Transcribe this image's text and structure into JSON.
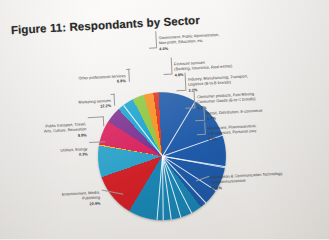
{
  "figure": {
    "title": "Figure 11: Respondants by Sector"
  },
  "chart_data": {
    "type": "pie",
    "title": "Figure 11: Respondants by Sector",
    "xlabel": "",
    "ylabel": "",
    "legend_position": "callout-labels",
    "grid": false,
    "unit": "%",
    "categories": [
      "Information & Communication Technology, Telecommunications",
      "Entertainment, Media, Publishing",
      "Marketing services",
      "Public transport, Travel, Arts, Culture, Recreation",
      "Utilities, Energy",
      "Other professional services",
      "Government, Public Administration, Non-profit, Education, etc",
      "Financial services (Banking, Insurance, Real-estate)",
      "Industry, Manufacturing, Transport, Logistics (B-to-B brands)",
      "Consumer products, Fast Moving Consumer Goods (B-to-C brands)",
      "Retail, Distribution, E-commerce",
      "Healthcare, Pharmaceutical, Life sciences, Personal care"
    ],
    "values": [
      42.1,
      20.9,
      12.2,
      8.8,
      0.3,
      6.8,
      4.4,
      4.8,
      3.2,
      2.7,
      2.2,
      1.7
    ],
    "colors": [
      "#1f5aa8",
      "#1b86b4",
      "#cf2027",
      "#2aa0c8",
      "#f2c10e",
      "#d81f5c",
      "#7b2f8f",
      "#1aa3d0",
      "#8cc63e",
      "#f5901f",
      "#e03020",
      "#d6252a"
    ],
    "slices": [
      {
        "label": "Information & Communication Technology, Telecommunications",
        "value": 42.1,
        "pct": "42.1%",
        "color": "#1f5aa8"
      },
      {
        "label": "Entertainment, Media, Publishing",
        "value": 20.9,
        "pct": "20.9%",
        "color": "#1b86b4"
      },
      {
        "label": "Marketing services",
        "value": 12.2,
        "pct": "12.2%",
        "color": "#cf2027"
      },
      {
        "label": "Public transport, Travel, Arts, Culture, Recreation",
        "value": 8.8,
        "pct": "8.8%",
        "color": "#2aa0c8"
      },
      {
        "label": "Utilities, Energy",
        "value": 0.3,
        "pct": "0.3%",
        "color": "#f2c10e"
      },
      {
        "label": "Other professional services",
        "value": 6.8,
        "pct": "6.8%",
        "color": "#d81f5c"
      },
      {
        "label": "Government, Public Administration, Non-profit, Education, etc",
        "value": 4.4,
        "pct": "4.4%",
        "color": "#7b2f8f"
      },
      {
        "label": "Financial services (Banking, Insurance, Real-estate)",
        "value": 4.8,
        "pct": "4.8%",
        "color": "#1aa3d0"
      },
      {
        "label": "Industry, Manufacturing, Transport, Logistics (B-to-B brands)",
        "value": 3.2,
        "pct": "3.2%",
        "color": "#8cc63e"
      },
      {
        "label": "Consumer products, Fast Moving Consumer Goods (B-to-C brands)",
        "value": 2.7,
        "pct": "2.7%",
        "color": "#f5901f"
      },
      {
        "label": "Retail, Distribution, E-commerce",
        "value": 2.2,
        "pct": "2.2%",
        "color": "#e03020"
      },
      {
        "label": "Healthcare, Pharmaceutical, Life sciences, Personal care",
        "value": 1.7,
        "pct": "1.7%",
        "color": "#d6252a"
      }
    ]
  },
  "labels": {
    "government": {
      "text": "Government, Public Administration,\nNon-profit, Education, etc",
      "pct": "4.4%"
    },
    "financial": {
      "text": "Financial services\n(Banking, Insurance, Real-estate)",
      "pct": "4.8%"
    },
    "industry": {
      "text": "Industry, Manufacturing, Transport,\nLogistics (B-to-B brands)",
      "pct": "3.2%"
    },
    "consumer": {
      "text": "Consumer products, Fast Moving\nConsumer Goods (B-to-C brands)",
      "pct": "2.7%"
    },
    "retail": {
      "text": "Retail, Distribution, E-commerce",
      "pct": "2.2%"
    },
    "retail2": {
      "text": "",
      "pct": "1.7%"
    },
    "healthcare": {
      "text": "Healthcare, Pharmaceutical,\nLife sciences, Personal care",
      "pct": "0.5%"
    },
    "ict": {
      "text": "Information & Communication Technology,\nTelecommunications",
      "pct": "42.1%"
    },
    "entertainment": {
      "text": "Entertainment, Media,\nPublishing",
      "pct": "20.9%"
    },
    "utilities": {
      "text": "Utilities, Energy",
      "pct": "0.3%"
    },
    "transport": {
      "text": "Public transport, Travel,\nArts, Culture, Recreation",
      "pct": "8.8%"
    },
    "marketing": {
      "text": "Marketing services",
      "pct": "12.2%"
    },
    "other": {
      "text": "Other professional services",
      "pct": "6.8%"
    }
  }
}
